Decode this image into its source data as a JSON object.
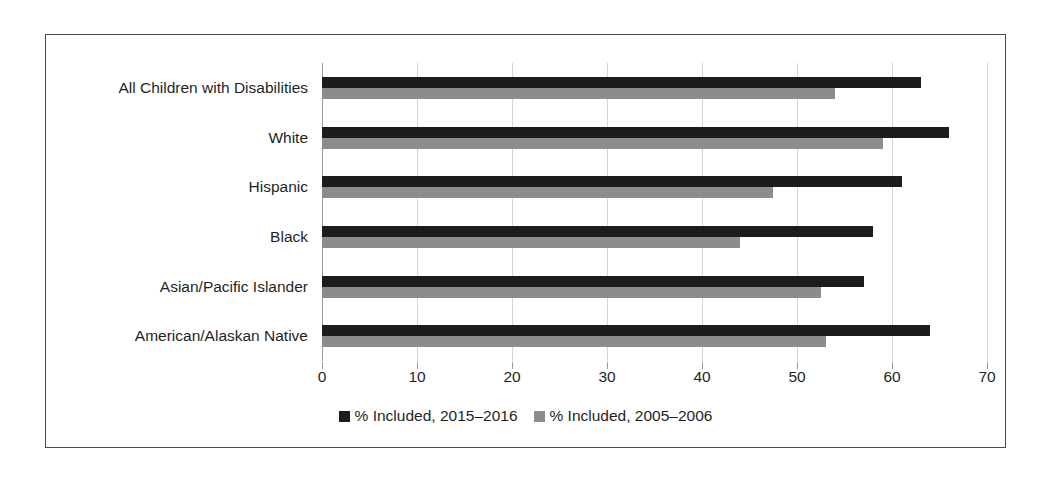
{
  "chart_data": {
    "type": "bar",
    "orientation": "horizontal",
    "title": "",
    "xlabel": "",
    "ylabel": "",
    "xlim": [
      0,
      70
    ],
    "xticks": [
      0,
      10,
      20,
      30,
      40,
      50,
      60,
      70
    ],
    "xtick_labels": [
      "0",
      "10",
      "20",
      "30",
      "40",
      "50",
      "60",
      "70"
    ],
    "grid": true,
    "legend_position": "bottom",
    "categories": [
      "All Children with Disabilities",
      "White",
      "Hispanic",
      "Black",
      "Asian/Pacific Islander",
      "American/Alaskan Native"
    ],
    "series": [
      {
        "name": "% Included, 2015–2016",
        "color": "#1c1c1c",
        "values": [
          63,
          66,
          61,
          58,
          57,
          64
        ]
      },
      {
        "name": "% Included, 2005–2006",
        "color": "#8c8c8c",
        "values": [
          54,
          59,
          47.5,
          44,
          52.5,
          53
        ]
      }
    ]
  },
  "legend": {
    "items": [
      {
        "label": "% Included, 2015–2016",
        "color": "#1c1c1c"
      },
      {
        "label": "% Included, 2005–2006",
        "color": "#8c8c8c"
      }
    ]
  },
  "colors": {
    "series_recent": "#1c1c1c",
    "series_older": "#8c8c8c",
    "frame_border": "#4a4a4a",
    "gridline": "#d4d4d4",
    "axis": "#9a9a9a",
    "text": "#1f1f1f",
    "background": "#ffffff"
  }
}
